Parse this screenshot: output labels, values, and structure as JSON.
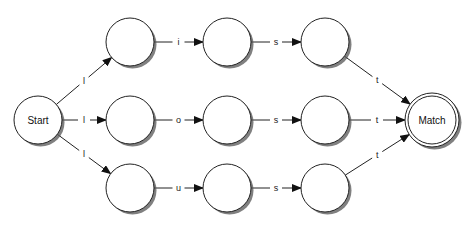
{
  "diagram": {
    "type": "state-machine",
    "nodes": [
      {
        "id": "start",
        "label": "Start",
        "x": 38,
        "y": 120,
        "accepting": false
      },
      {
        "id": "a1",
        "label": "",
        "x": 130,
        "y": 42,
        "accepting": false
      },
      {
        "id": "a2",
        "label": "",
        "x": 227,
        "y": 42,
        "accepting": false
      },
      {
        "id": "a3",
        "label": "",
        "x": 325,
        "y": 42,
        "accepting": false
      },
      {
        "id": "b1",
        "label": "",
        "x": 130,
        "y": 120,
        "accepting": false
      },
      {
        "id": "b2",
        "label": "",
        "x": 227,
        "y": 120,
        "accepting": false
      },
      {
        "id": "b3",
        "label": "",
        "x": 325,
        "y": 120,
        "accepting": false
      },
      {
        "id": "c1",
        "label": "",
        "x": 130,
        "y": 188,
        "accepting": false
      },
      {
        "id": "c2",
        "label": "",
        "x": 227,
        "y": 188,
        "accepting": false
      },
      {
        "id": "c3",
        "label": "",
        "x": 325,
        "y": 188,
        "accepting": false
      },
      {
        "id": "match",
        "label": "Match",
        "x": 432,
        "y": 120,
        "accepting": true
      }
    ],
    "edges": [
      {
        "from": "start",
        "to": "a1",
        "label": "l"
      },
      {
        "from": "start",
        "to": "b1",
        "label": "l"
      },
      {
        "from": "start",
        "to": "c1",
        "label": "l"
      },
      {
        "from": "a1",
        "to": "a2",
        "label": "i"
      },
      {
        "from": "a2",
        "to": "a3",
        "label": "s"
      },
      {
        "from": "a3",
        "to": "match",
        "label": "t"
      },
      {
        "from": "b1",
        "to": "b2",
        "label": "o"
      },
      {
        "from": "b2",
        "to": "b3",
        "label": "s"
      },
      {
        "from": "b3",
        "to": "match",
        "label": "t"
      },
      {
        "from": "c1",
        "to": "c2",
        "label": "u"
      },
      {
        "from": "c2",
        "to": "c3",
        "label": "s"
      },
      {
        "from": "c3",
        "to": "match",
        "label": "t"
      }
    ]
  },
  "colors": {
    "stroke": "#222222",
    "fill": "#ffffff",
    "shadow": "#555555"
  }
}
